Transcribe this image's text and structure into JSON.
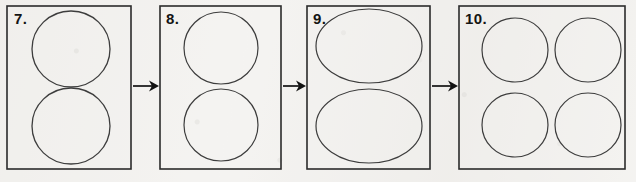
{
  "figure": {
    "background_color": "#f4f3f1",
    "ink_color": "#2b2b2b",
    "label_color": "#141414",
    "width": 636,
    "height": 182
  },
  "panels": [
    {
      "id": "panel-7",
      "number_label": "7.",
      "label_x": 14,
      "label_y": 11,
      "box": {
        "x": 7,
        "y": 6,
        "width": 124,
        "height": 163
      },
      "shape_kind": "circle",
      "shape_count": 2,
      "shapes": [
        {
          "name": "circle-top",
          "cx": 71,
          "cy": 49,
          "rx": 39,
          "ry": 38
        },
        {
          "name": "circle-bottom",
          "cx": 71,
          "cy": 126,
          "rx": 39,
          "ry": 38
        }
      ]
    },
    {
      "id": "panel-8",
      "number_label": "8.",
      "label_x": 166,
      "label_y": 11,
      "box": {
        "x": 160,
        "y": 6,
        "width": 121,
        "height": 163
      },
      "shape_kind": "circle",
      "shape_count": 2,
      "shapes": [
        {
          "name": "circle-top",
          "cx": 221,
          "cy": 48,
          "rx": 37,
          "ry": 36
        },
        {
          "name": "circle-bottom",
          "cx": 221,
          "cy": 125,
          "rx": 37,
          "ry": 36
        }
      ]
    },
    {
      "id": "panel-9",
      "number_label": "9.",
      "label_x": 313,
      "label_y": 11,
      "box": {
        "x": 307,
        "y": 6,
        "width": 123,
        "height": 163
      },
      "shape_kind": "ellipse",
      "shape_count": 2,
      "shapes": [
        {
          "name": "ellipse-top",
          "cx": 369,
          "cy": 46,
          "rx": 53,
          "ry": 37
        },
        {
          "name": "ellipse-bottom",
          "cx": 369,
          "cy": 126,
          "rx": 53,
          "ry": 37
        }
      ]
    },
    {
      "id": "panel-10",
      "number_label": "10.",
      "label_x": 465,
      "label_y": 11,
      "box": {
        "x": 459,
        "y": 6,
        "width": 166,
        "height": 163
      },
      "shape_kind": "circle",
      "shape_count": 4,
      "shapes": [
        {
          "name": "circle-top-left",
          "cx": 515,
          "cy": 50,
          "rx": 33,
          "ry": 32
        },
        {
          "name": "circle-top-right",
          "cx": 588,
          "cy": 50,
          "rx": 33,
          "ry": 32
        },
        {
          "name": "circle-bottom-left",
          "cx": 515,
          "cy": 125,
          "rx": 33,
          "ry": 32
        },
        {
          "name": "circle-bottom-right",
          "cx": 588,
          "cy": 125,
          "rx": 33,
          "ry": 32
        }
      ]
    }
  ],
  "arrows": [
    {
      "id": "arrow-7-to-8",
      "name": "arrow-panel-7-to-8",
      "x1": 133,
      "x2": 159,
      "y": 86,
      "direction": "right"
    },
    {
      "id": "arrow-8-to-9",
      "name": "arrow-panel-8-to-9",
      "x1": 283,
      "x2": 306,
      "y": 86,
      "direction": "right"
    },
    {
      "id": "arrow-9-to-10",
      "name": "arrow-panel-9-to-10",
      "x1": 432,
      "x2": 458,
      "y": 86,
      "direction": "right"
    }
  ]
}
